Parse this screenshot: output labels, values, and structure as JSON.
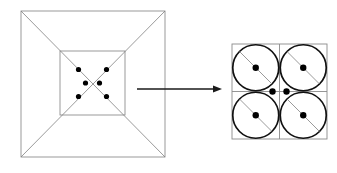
{
  "figure": {
    "background_color": "#ffffff",
    "line_color_thin": "#808080",
    "line_color_bold": "#111111",
    "dot_color": "#000000",
    "arrow_color": "#1a1a1a"
  },
  "left_figure": {
    "name": "outer-square-with-diagonals",
    "outer_square": {
      "x": 21,
      "y": 11,
      "width": 144,
      "height": 146
    },
    "inner_square": {
      "x": 60,
      "y": 51,
      "width": 65,
      "height": 64
    },
    "diagonals": "both",
    "dot_radius": 2.6,
    "dots": [
      {
        "label": "upper-left-dot",
        "cx": 78.5,
        "cy": 69.5
      },
      {
        "label": "upper-right-dot",
        "cx": 106.5,
        "cy": 69.5
      },
      {
        "label": "center-left-dot",
        "cx": 85.5,
        "cy": 83.0
      },
      {
        "label": "center-right-dot",
        "cx": 99.5,
        "cy": 83.0
      },
      {
        "label": "lower-left-dot",
        "cx": 78.5,
        "cy": 96.5
      },
      {
        "label": "lower-right-dot",
        "cx": 106.5,
        "cy": 96.5
      }
    ]
  },
  "arrow": {
    "name": "magnification-arrow",
    "x1": 137,
    "y1": 89,
    "x2": 222,
    "y2": 89,
    "head_length": 9,
    "head_width": 7
  },
  "right_figure": {
    "name": "magnified-cell-grid",
    "outer_square": {
      "x": 232,
      "y": 44,
      "width": 95,
      "height": 95
    },
    "grid_rows": 2,
    "grid_cols": 2,
    "cell_size": 47.5,
    "circle_radius": 23.0,
    "dot_radius": 3.2,
    "cells": [
      {
        "label": "cell-top-left",
        "cx": 255.75,
        "cy": 67.75,
        "diagonal": "nw-se",
        "center_dot": true
      },
      {
        "label": "cell-top-right",
        "cx": 303.25,
        "cy": 67.75,
        "diagonal": "nw-se",
        "center_dot": true
      },
      {
        "label": "cell-bottom-left",
        "cx": 255.75,
        "cy": 115.25,
        "diagonal": "nw-se",
        "center_dot": true
      },
      {
        "label": "cell-bottom-right",
        "cx": 303.25,
        "cy": 115.25,
        "diagonal": "nw-se",
        "center_dot": true
      }
    ],
    "center_dots": [
      {
        "label": "center-dot-left",
        "cx": 272.5,
        "cy": 91.5
      },
      {
        "label": "center-dot-right",
        "cx": 286.5,
        "cy": 91.5
      }
    ]
  }
}
